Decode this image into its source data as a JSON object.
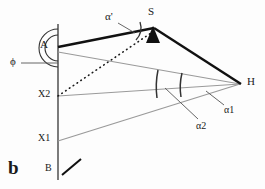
{
  "figure": {
    "panel_label": "b",
    "labels": {
      "A": "A",
      "B": "B",
      "S": "S",
      "H": "H",
      "X1": "X1",
      "X2": "X2",
      "phi": "ϕ",
      "alpha_prime": "α'",
      "alpha1": "α1",
      "alpha2": "α2"
    },
    "colors": {
      "stroke_dark": "#1a1a1a",
      "stroke_gray": "#9a9a9a",
      "marker_fill": "#111111",
      "background": "#fdfdfd"
    },
    "geometry": {
      "points": {
        "A": {
          "x": 58,
          "y": 48
        },
        "B": {
          "x": 58,
          "y": 176
        },
        "S": {
          "x": 153,
          "y": 31
        },
        "H": {
          "x": 240,
          "y": 84
        },
        "X1": {
          "x": 58,
          "y": 141
        },
        "X2": {
          "x": 58,
          "y": 96
        }
      },
      "vertical_axis": {
        "x": 58,
        "y_top": 24,
        "y_bottom": 180
      },
      "thick_segments": [
        {
          "from": "A",
          "to": "S"
        },
        {
          "from": "S",
          "to": "H"
        }
      ],
      "gray_segments": [
        {
          "from": "A",
          "to": "H"
        },
        {
          "from": "X2",
          "to": "H"
        },
        {
          "from": "X1",
          "to": "H"
        }
      ],
      "dotted_segments": [
        {
          "from": "X2",
          "to": "S"
        }
      ],
      "short_tick": {
        "x1": 63,
        "y1": 174,
        "x2": 80,
        "y2": 160
      },
      "phi_leader": {
        "x1": 21,
        "y1": 63,
        "x2": 58,
        "y2": 63
      },
      "alpha_prime_leader": {
        "x1": 119,
        "y1": 23,
        "x2": 134,
        "y2": 33
      },
      "alpha1_leader": {
        "x1": 223,
        "y1": 105,
        "x2": 205,
        "y2": 92
      },
      "alpha2_leader": {
        "x1": 197,
        "y1": 120,
        "x2": 165,
        "y2": 88
      },
      "arcs": [
        {
          "name": "angle-at-A-outer",
          "cx": 58,
          "cy": 48,
          "r": 19
        },
        {
          "name": "angle-at-A-inner",
          "cx": 58,
          "cy": 48,
          "r": 13
        },
        {
          "name": "angle-at-S",
          "cx": 153,
          "cy": 31,
          "r": 18
        },
        {
          "name": "angle-alpha2-at-H",
          "cx": 240,
          "cy": 84,
          "r": 84
        },
        {
          "name": "angle-alpha1-at-H",
          "cx": 240,
          "cy": 84,
          "r": 60
        }
      ]
    }
  }
}
